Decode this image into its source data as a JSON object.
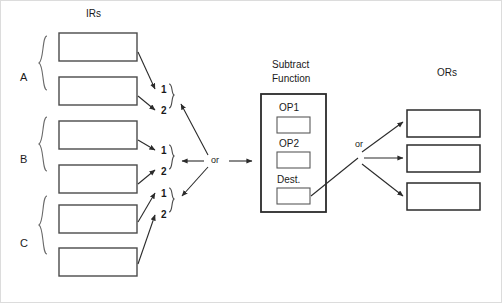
{
  "figure": {
    "border_color": "#d8d8d8",
    "line_color": "#3a3a3a",
    "box_border_color": "#4a4a4a",
    "text_color": "#1a1a1a"
  },
  "headings": {
    "irs": "IRs",
    "ors": "ORs",
    "subtract_line1": "Subtract",
    "subtract_line2": "Function"
  },
  "groups": [
    {
      "label": "A",
      "operands": [
        "1",
        "2"
      ]
    },
    {
      "label": "B",
      "operands": [
        "1",
        "2"
      ]
    },
    {
      "label": "C",
      "operands": [
        "1",
        "2"
      ]
    }
  ],
  "ir_boxes": [
    {
      "name": "ir-box-a1",
      "value": ""
    },
    {
      "name": "ir-box-a2",
      "value": ""
    },
    {
      "name": "ir-box-b1",
      "value": ""
    },
    {
      "name": "ir-box-b2",
      "value": ""
    },
    {
      "name": "ir-box-c1",
      "value": ""
    },
    {
      "name": "ir-box-c2",
      "value": ""
    }
  ],
  "connectors": {
    "or_left": "or",
    "or_right": "or"
  },
  "subtract_function": {
    "fields": [
      {
        "label": "OP1",
        "value": ""
      },
      {
        "label": "OP2",
        "value": ""
      },
      {
        "label": "Dest.",
        "value": ""
      }
    ]
  },
  "or_boxes": [
    {
      "name": "or-box-1",
      "value": ""
    },
    {
      "name": "or-box-2",
      "value": ""
    },
    {
      "name": "or-box-3",
      "value": ""
    }
  ]
}
